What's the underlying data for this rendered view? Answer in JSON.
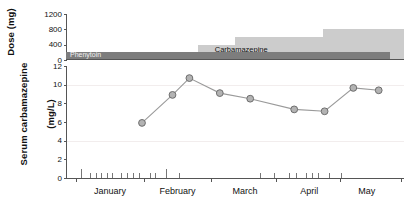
{
  "chart_data": {
    "type": "line",
    "title": "",
    "xlabel": "",
    "ylabel": "Serum carbamazepine (mg/L)",
    "panels": [
      {
        "name": "dose-panel",
        "ylabel": "Dose (mg)",
        "ylim": [
          0,
          1200
        ],
        "yticks": [
          0,
          400,
          800,
          1200
        ],
        "ytick_labels": [
          "0",
          "400",
          "800",
          "1200"
        ],
        "type": "area",
        "series": [
          {
            "name": "Phenytoin",
            "label": "Phenytoin",
            "color": "#7d7d7d",
            "steps": [
              {
                "x_start": 0,
                "x_end": 96,
                "value": 200
              }
            ]
          },
          {
            "name": "Carbamazepine",
            "label": "Carbamazepine",
            "color": "#cccccc",
            "steps": [
              {
                "x_start": 26,
                "x_end": 39,
                "value": 200
              },
              {
                "x_start": 39,
                "x_end": 50,
                "value": 400
              },
              {
                "x_start": 50,
                "x_end": 76,
                "value": 600
              },
              {
                "x_start": 76,
                "x_end": 100,
                "value": 800
              }
            ]
          }
        ]
      },
      {
        "name": "serum-panel",
        "ylabel": "Serum carbamazepine (mg/L)",
        "ylim": [
          0,
          12
        ],
        "yticks": [
          0,
          2,
          4,
          6,
          8,
          10,
          12
        ],
        "ytick_labels": [
          "0",
          "2",
          "4",
          "6",
          "8",
          "10",
          "12"
        ],
        "gridlines": [
          4,
          10
        ],
        "type": "line",
        "marker": "circle",
        "marker_color": "#b3b3b3",
        "line_color": "#9a9a9a",
        "points": [
          {
            "x": 22.5,
            "y": 5.9,
            "month": "late January"
          },
          {
            "x": 31.5,
            "y": 8.9,
            "month": "early February"
          },
          {
            "x": 36.5,
            "y": 10.7,
            "month": "February"
          },
          {
            "x": 45.5,
            "y": 9.1,
            "month": "mid February"
          },
          {
            "x": 54.5,
            "y": 8.5,
            "month": "March"
          },
          {
            "x": 67.5,
            "y": 7.35,
            "month": "late March"
          },
          {
            "x": 76.5,
            "y": 7.15,
            "month": "April"
          },
          {
            "x": 85.0,
            "y": 9.65,
            "month": "late April"
          },
          {
            "x": 92.5,
            "y": 9.4,
            "month": "May"
          }
        ]
      }
    ],
    "xaxis": {
      "months": [
        "January",
        "February",
        "March",
        "April",
        "May"
      ],
      "month_centers": [
        13,
        33,
        53,
        72,
        89
      ],
      "month_boundaries": [
        3,
        23,
        43,
        62,
        81,
        99
      ],
      "rug_label": "dosing-events",
      "rug_ticks": [
        {
          "x": 4.5,
          "h": 9
        },
        {
          "x": 7.0,
          "h": 5
        },
        {
          "x": 8.8,
          "h": 5
        },
        {
          "x": 10.4,
          "h": 5
        },
        {
          "x": 12.0,
          "h": 5
        },
        {
          "x": 13.6,
          "h": 5
        },
        {
          "x": 16.2,
          "h": 5
        },
        {
          "x": 18.0,
          "h": 5
        },
        {
          "x": 19.8,
          "h": 5
        },
        {
          "x": 21.6,
          "h": 5
        },
        {
          "x": 24.8,
          "h": 5
        },
        {
          "x": 26.4,
          "h": 5
        },
        {
          "x": 29.6,
          "h": 9
        },
        {
          "x": 33.5,
          "h": 5
        },
        {
          "x": 57.5,
          "h": 5
        },
        {
          "x": 61.5,
          "h": 5
        },
        {
          "x": 66.0,
          "h": 5
        },
        {
          "x": 68.0,
          "h": 5
        },
        {
          "x": 71.0,
          "h": 5
        },
        {
          "x": 72.8,
          "h": 5
        },
        {
          "x": 74.6,
          "h": 5
        },
        {
          "x": 77.8,
          "h": 5
        },
        {
          "x": 81.5,
          "h": 5
        }
      ]
    }
  },
  "labels": {
    "dose_title": "Dose (mg)",
    "serum_title_line1": "Serum carbamazepine",
    "serum_title_line2": "(mg/L)",
    "phenytoin": "Phenytoin",
    "carbamazepine": "Carbamazepine"
  }
}
